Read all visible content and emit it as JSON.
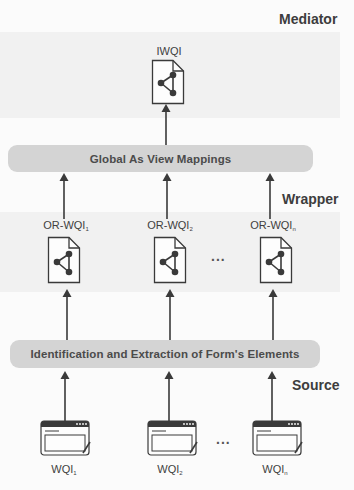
{
  "layers": {
    "mediator": {
      "label": "Mediator"
    },
    "wrapper": {
      "label": "Wrapper"
    },
    "source": {
      "label": "Source"
    }
  },
  "mediator_node": {
    "label": "IWQI",
    "icon": "shared-document-icon"
  },
  "mappings_bar": {
    "label": "Global As View Mappings"
  },
  "wrapper_nodes": [
    {
      "label": "OR-WQI",
      "subscript": "1",
      "icon": "shared-document-icon"
    },
    {
      "label": "OR-WQI",
      "subscript": "2",
      "icon": "shared-document-icon"
    },
    {
      "label": "OR-WQI",
      "subscript": "n",
      "icon": "shared-document-icon"
    }
  ],
  "extraction_bar": {
    "label": "Identification and Extraction of Form's Elements"
  },
  "source_nodes": [
    {
      "label": "WQI",
      "subscript": "1",
      "icon": "web-form-window-icon"
    },
    {
      "label": "WQI",
      "subscript": "2",
      "icon": "web-form-window-icon"
    },
    {
      "label": "WQI",
      "subscript": "n",
      "icon": "web-form-window-icon"
    }
  ],
  "ellipsis": "...",
  "colors": {
    "panel": "#f1f1f1",
    "bar": "#d4d4d4",
    "stroke": "#3a3a3a",
    "background": "#fbfbfb"
  }
}
